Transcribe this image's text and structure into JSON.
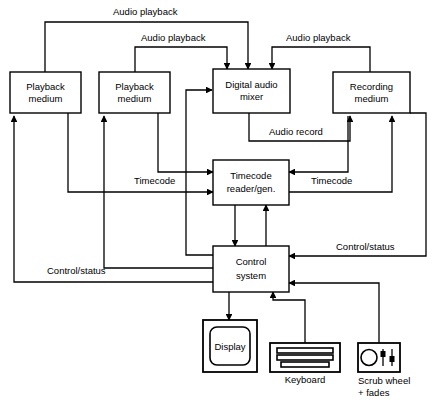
{
  "diagram": {
    "nodes": [
      {
        "id": "playback1",
        "label_line1": "Playback",
        "label_line2": "medium"
      },
      {
        "id": "playback2",
        "label_line1": "Playback",
        "label_line2": "medium"
      },
      {
        "id": "mixer",
        "label_line1": "Digital audio",
        "label_line2": "mixer"
      },
      {
        "id": "recording",
        "label_line1": "Recording",
        "label_line2": "medium"
      },
      {
        "id": "timecode",
        "label_line1": "Timecode",
        "label_line2": "reader/gen."
      },
      {
        "id": "control",
        "label_line1": "Control",
        "label_line2": "system"
      }
    ],
    "devices": [
      {
        "id": "display",
        "label": "Display",
        "caption": ""
      },
      {
        "id": "keyboard",
        "label": "",
        "caption": "Keyboard"
      },
      {
        "id": "scrub",
        "label": "",
        "caption_line1": "Scrub wheel",
        "caption_line2": "+ fades"
      }
    ],
    "edge_labels": [
      {
        "id": "audio-playback-top",
        "text": "Audio playback"
      },
      {
        "id": "audio-playback-mid",
        "text": "Audio playback"
      },
      {
        "id": "audio-playback-right",
        "text": "Audio playback"
      },
      {
        "id": "audio-record",
        "text": "Audio record"
      },
      {
        "id": "timecode-left",
        "text": "Timecode"
      },
      {
        "id": "timecode-right",
        "text": "Timecode"
      },
      {
        "id": "control-status-right",
        "text": "Control/status"
      },
      {
        "id": "control-status-left",
        "text": "Control/status"
      }
    ],
    "colors": {
      "stroke": "#000000",
      "background": "#ffffff"
    }
  }
}
